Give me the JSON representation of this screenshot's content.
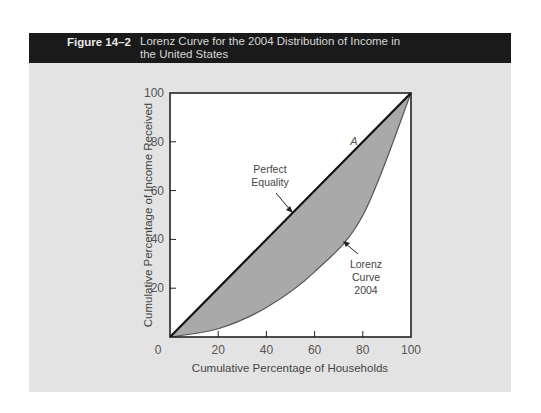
{
  "figure": {
    "number": "Figure 14–2",
    "title_line1": "Lorenz Curve for the 2004 Distribution of Income in",
    "title_line2": "the United States"
  },
  "colors": {
    "header_bg": "#1a1a1a",
    "panel_bg": "#e3e3e3",
    "plot_bg": "#ffffff",
    "shaded_area": "#a9a9a9",
    "line": "#111111"
  },
  "chart_data": {
    "type": "line",
    "title": "Lorenz Curve for the 2004 Distribution of Income in the United States",
    "xlabel": "Cumulative Percentage of Households",
    "ylabel": "Cumulative Percentage of Income Received",
    "xlim": [
      0,
      100
    ],
    "ylim": [
      0,
      100
    ],
    "x_ticks": [
      "0",
      "20",
      "40",
      "60",
      "80",
      "100"
    ],
    "y_ticks": [
      "0",
      "20",
      "40",
      "60",
      "80",
      "100"
    ],
    "grid": false,
    "legend": null,
    "x": [
      0,
      20,
      40,
      60,
      80,
      100
    ],
    "series": [
      {
        "name": "Perfect Equality",
        "values": [
          0,
          20,
          40,
          60,
          80,
          100
        ]
      },
      {
        "name": "Lorenz Curve 2004",
        "values": [
          0,
          3.4,
          12.1,
          26.7,
          49.8,
          100
        ]
      }
    ],
    "shaded_region": "Area between Perfect Equality line and Lorenz Curve",
    "annotations": [
      {
        "text": "Perfect Equality",
        "points_to": "Perfect Equality line",
        "near": [
          50,
          50
        ]
      },
      {
        "text": "Lorenz Curve 2004",
        "points_to": "Lorenz Curve",
        "near": [
          73,
          41
        ]
      },
      {
        "text": "A",
        "near": [
          76,
          80
        ]
      }
    ]
  },
  "labels": {
    "perfect_1": "Perfect",
    "perfect_2": "Equality",
    "lorenz_1": "Lorenz",
    "lorenz_2": "Curve",
    "lorenz_3": "2004",
    "point_a": "A"
  }
}
